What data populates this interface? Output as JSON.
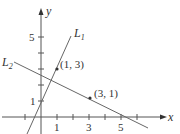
{
  "diagram": {
    "axes": {
      "x_label": "x",
      "y_label": "y",
      "x_tick_labels": [
        "1",
        "3",
        "5"
      ],
      "y_tick_labels": [
        "1",
        "5"
      ]
    },
    "lines": [
      {
        "name": "L",
        "subscript": "1",
        "through": [
          [
            0,
            1
          ],
          [
            1,
            3
          ]
        ]
      },
      {
        "name": "L",
        "subscript": "2",
        "through": [
          [
            3,
            1
          ],
          [
            5,
            0
          ]
        ]
      }
    ],
    "points": [
      {
        "label": "(1, 3)",
        "x": 1,
        "y": 3
      },
      {
        "label": "(3, 1)",
        "x": 3,
        "y": 1
      }
    ],
    "colors": {
      "axis": "#555555",
      "line": "#666666",
      "text": "#333333"
    }
  }
}
